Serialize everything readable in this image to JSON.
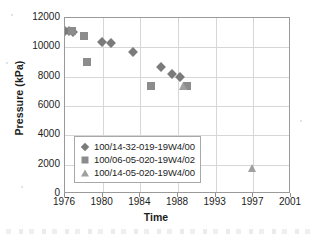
{
  "chart_data": {
    "type": "scatter",
    "title": "",
    "xlabel": "Time",
    "ylabel": "Pressure (kPa)",
    "xtick_labels": [
      "1976",
      "1980",
      "1984",
      "1988",
      "1993",
      "1997",
      "2001"
    ],
    "ytick_labels": [
      "0",
      "2000",
      "4000",
      "6000",
      "8000",
      "10000",
      "12000"
    ],
    "ylim": [
      0,
      12000
    ],
    "ylim_step": 2000,
    "xlim": [
      1976,
      2001
    ],
    "grid": "both",
    "legend_position": "inside-lower-left",
    "series": [
      {
        "name": "100/14-32-019-19W4/00",
        "marker": "diamond",
        "color": "#7b7b7b",
        "points": [
          {
            "x": 1976.0,
            "y": 11150
          },
          {
            "x": 1976.4,
            "y": 11100
          },
          {
            "x": 1976.8,
            "y": 11080
          },
          {
            "x": 1979.9,
            "y": 10350
          },
          {
            "x": 1980.9,
            "y": 10330
          },
          {
            "x": 1983.2,
            "y": 9700
          },
          {
            "x": 1986.2,
            "y": 8680
          },
          {
            "x": 1987.4,
            "y": 8180
          },
          {
            "x": 1988.3,
            "y": 8000
          }
        ]
      },
      {
        "name": "100/06-05-020-19W4/02",
        "marker": "square",
        "color": "#8c8c8c",
        "points": [
          {
            "x": 1976.7,
            "y": 11120
          },
          {
            "x": 1978.0,
            "y": 10750
          },
          {
            "x": 1978.3,
            "y": 8980
          },
          {
            "x": 1985.1,
            "y": 7400
          },
          {
            "x": 1989.2,
            "y": 7380
          }
        ]
      },
      {
        "name": "100/14-05-020-19W4/00",
        "marker": "triangle",
        "color": "#a0a0a0",
        "points": [
          {
            "x": 1988.6,
            "y": 7380
          },
          {
            "x": 1996.9,
            "y": 1800
          }
        ]
      }
    ]
  },
  "legend": {
    "items": [
      {
        "label": "100/14-32-019-19W4/00",
        "marker": "diamond"
      },
      {
        "label": "100/06-05-020-19W4/02",
        "marker": "square"
      },
      {
        "label": "100/14-05-020-19W4/00",
        "marker": "triangle"
      }
    ]
  }
}
